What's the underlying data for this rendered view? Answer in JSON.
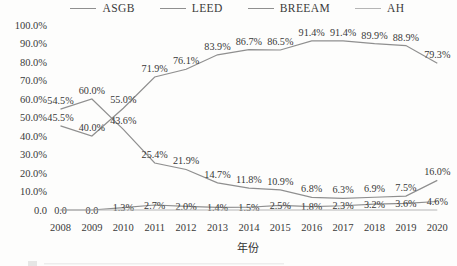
{
  "chart_data": {
    "type": "line",
    "title": "",
    "xlabel": "年份",
    "ylabel": "",
    "x": [
      2008,
      2009,
      2010,
      2011,
      2012,
      2013,
      2014,
      2015,
      2016,
      2017,
      2018,
      2019,
      2020
    ],
    "ylim": [
      0,
      100
    ],
    "grid": false,
    "legend_position": "top",
    "y_ticks": [
      "100.0%",
      "90.0%",
      "80.0%",
      "70.0%",
      "60.0%",
      "50.0%",
      "40.0%",
      "30.0%",
      "20.0%",
      "10.0%",
      "0.0"
    ],
    "series": [
      {
        "name": "ASGB",
        "color": "#8f8f8f",
        "values": [
          45.5,
          40.0,
          55.0,
          71.9,
          76.1,
          83.9,
          86.7,
          86.5,
          91.4,
          91.4,
          89.9,
          88.9,
          79.3
        ],
        "labels": [
          "45.5%",
          "40.0%",
          "55.0%",
          "71.9%",
          "76.1%",
          "83.9%",
          "86.7%",
          "86.5%",
          "91.4%",
          "91.4%",
          "89.9%",
          "88.9%",
          "79.3%"
        ]
      },
      {
        "name": "LEED",
        "color": "#8f8f8f",
        "values": [
          54.5,
          60.0,
          43.6,
          25.4,
          21.9,
          14.7,
          11.8,
          10.9,
          6.8,
          6.3,
          6.9,
          7.5,
          16.0
        ],
        "labels": [
          "54.5%",
          "60.0%",
          "43.6%",
          "25.4%",
          "21.9%",
          "14.7%",
          "11.8%",
          "10.9%",
          "6.8%",
          "6.3%",
          "6.9%",
          "7.5%",
          "16.0%"
        ]
      },
      {
        "name": "BREEAM",
        "color": "#8f8f8f",
        "values": [
          0.0,
          0.0,
          1.3,
          2.7,
          2.0,
          1.4,
          1.5,
          2.5,
          1.8,
          2.3,
          3.2,
          3.6,
          4.6
        ],
        "labels": [
          "0.0",
          "0.0",
          "1.3%",
          "2.7%",
          "2.0%",
          "1.4%",
          "1.5%",
          "2.5%",
          "1.8%",
          "2.3%",
          "3.2%",
          "3.6%",
          "4.6%"
        ]
      },
      {
        "name": "AH",
        "color": "#b5b5b5",
        "values": [
          0,
          0,
          0,
          0,
          0,
          0,
          0,
          0,
          0,
          0,
          0,
          0,
          0
        ],
        "labels": []
      }
    ]
  },
  "colors": {
    "background": "#fdfdfc",
    "line": "#8f8f8f",
    "line_light": "#b5b5b5",
    "text": "#3a3a3a"
  }
}
